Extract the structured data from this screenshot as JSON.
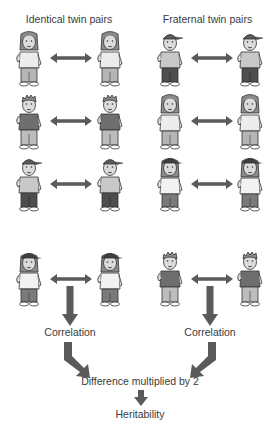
{
  "titles": {
    "identical": "Identical twin pairs",
    "fraternal": "Fraternal twin pairs"
  },
  "labels": {
    "correlation_left": "Correlation",
    "correlation_right": "Correlation",
    "difference": "Difference multiplied by 2",
    "heritability": "Heritability"
  },
  "colors": {
    "arrow": "#5a5a5a",
    "outline": "#333333",
    "skin": "#d8d8d8",
    "shirt_light": "#ececec",
    "shirt_mid": "#bdbdbd",
    "shirt_dark": "#7a7a7a",
    "pants_light": "#b5b5b5",
    "pants_dark": "#5c5c5c",
    "hair": "#8a8a8a",
    "cap": "#4a4a4a"
  },
  "identical_pairs": [
    {
      "left": "girl-long-hair",
      "right": "girl-long-hair"
    },
    {
      "left": "boy-spiky-dark-shirt",
      "right": "boy-spiky-dark-shirt"
    },
    {
      "left": "boy-cap",
      "right": "boy-cap"
    }
  ],
  "fraternal_pairs": [
    {
      "left": "boy-cap",
      "right": "boy-cap"
    },
    {
      "left": "girl-long-hair",
      "right": "girl-long-hair"
    },
    {
      "left": "girl-cap",
      "right": "girl-cap"
    }
  ],
  "example_pairs": {
    "identical": {
      "left": "girl-cap",
      "right": "girl-cap"
    },
    "fraternal": {
      "left": "boy-spiky-dark-shirt",
      "right": "boy-spiky-dark-shirt"
    }
  }
}
